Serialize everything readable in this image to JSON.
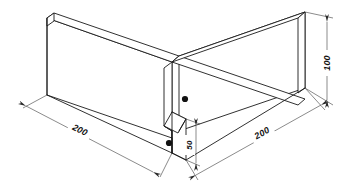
{
  "drawing": {
    "type": "isometric-technical-drawing",
    "subject": "L-shaped corner wall assembly",
    "background_color": "#ffffff",
    "line_color": "#1a1a1a",
    "dimension_line_color": "#3c3c3c",
    "text_color": "#111111"
  },
  "dimensions": [
    {
      "id": "left-leg-length",
      "label": "200",
      "orientation": "isometric-left",
      "position": "lower-left",
      "text_rotation_deg": 24
    },
    {
      "id": "right-leg-length",
      "label": "200",
      "orientation": "isometric-right",
      "position": "lower-right",
      "text_rotation_deg": -24
    },
    {
      "id": "wall-height",
      "label": "100",
      "orientation": "vertical",
      "position": "right-edge",
      "text_rotation_deg": -90
    },
    {
      "id": "step-height",
      "label": "50",
      "orientation": "vertical",
      "position": "inner-corner",
      "text_rotation_deg": -90
    }
  ],
  "features": [
    {
      "id": "hole-upper",
      "name": "mounting-hole",
      "shape": "circle"
    },
    {
      "id": "hole-lower",
      "name": "mounting-hole",
      "shape": "circle"
    }
  ]
}
